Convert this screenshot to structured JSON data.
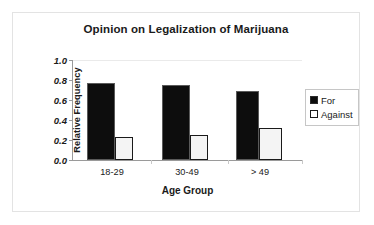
{
  "chart_data": {
    "type": "bar",
    "title": "Opinion on Legalization of Marijuana",
    "xlabel": "Age Group",
    "ylabel": "Relative Frequency",
    "categories": [
      "18-29",
      "30-49",
      "> 49"
    ],
    "series": [
      {
        "name": "For",
        "values": [
          0.77,
          0.75,
          0.69
        ],
        "color": "#0d0d0d"
      },
      {
        "name": "Against",
        "values": [
          0.23,
          0.25,
          0.32
        ],
        "color": "#ffffff"
      }
    ],
    "ylim": [
      0.0,
      1.0
    ],
    "yticks": [
      "1.0",
      "0.8",
      "0.6",
      "0.4",
      "0.2",
      "0.0"
    ],
    "ytick_values": [
      1.0,
      0.8,
      0.6,
      0.4,
      0.2,
      0.0
    ],
    "grid": "top-only",
    "legend_position": "right"
  },
  "legend": {
    "items": [
      {
        "label": "For",
        "icon": "filled-square-icon"
      },
      {
        "label": "Against",
        "icon": "outlined-square-icon"
      }
    ]
  }
}
